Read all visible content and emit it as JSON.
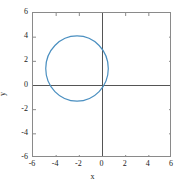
{
  "chart_data": {
    "type": "line",
    "title": "",
    "xlabel": "x",
    "ylabel": "y",
    "xlim": [
      -6,
      6
    ],
    "ylim": [
      -6,
      6
    ],
    "xticks": [
      -6,
      -4,
      -2,
      0,
      2,
      4,
      6
    ],
    "yticks": [
      -6,
      -4,
      -2,
      0,
      2,
      4,
      6
    ],
    "xtick_labels": [
      "-6",
      "-4",
      "-2",
      "0",
      "2",
      "4",
      "6"
    ],
    "ytick_labels": [
      "-6",
      "-4",
      "-2",
      "0",
      "2",
      "4",
      "6"
    ],
    "grid": false,
    "legend": null,
    "aspect": "equal",
    "series": [
      {
        "name": "circle",
        "kind": "circle",
        "center_x": -2.2,
        "center_y": 1.4,
        "radius": 2.7,
        "color": "#4a8fc0",
        "linewidth": 1.2,
        "closed": true
      }
    ],
    "annotations": [
      {
        "name": "x-axis-line",
        "kind": "axhline",
        "y": 0,
        "color": "#555555"
      },
      {
        "name": "y-axis-line",
        "kind": "axvline",
        "x": 0,
        "color": "#555555"
      }
    ]
  },
  "figure": {
    "background": "#ffffff",
    "frame_color": "#8a8a8a",
    "tick_color": "#8a8a8a",
    "text_color": "#1a1a1a"
  }
}
